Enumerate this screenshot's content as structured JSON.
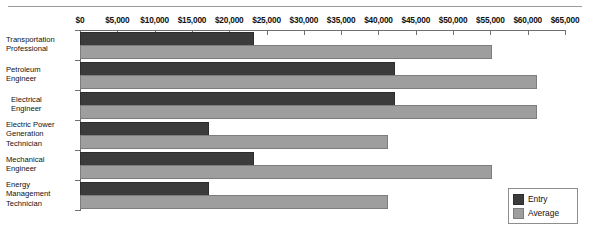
{
  "chart_data": {
    "type": "bar",
    "orientation": "horizontal",
    "title": "",
    "xlabel": "",
    "ylabel": "",
    "xlim": [
      0,
      65000
    ],
    "xtick_values": [
      0,
      5000,
      10000,
      15000,
      20000,
      25000,
      30000,
      35000,
      40000,
      45000,
      50000,
      55000,
      60000,
      65000
    ],
    "xtick_labels": [
      "$0",
      "$5,000",
      "$10,000",
      "$15,000",
      "$20,000",
      "$25,000",
      "$30,000",
      "$35,000",
      "$40,000",
      "$45,000",
      "$50,000",
      "$55,000",
      "$60,000",
      "$65,000"
    ],
    "grid": false,
    "legend_position": "bottom-right",
    "categories": [
      "Transportation Professional",
      "Petroleum Engineer",
      "Electrical Engineer",
      "Electric Power Generation Technician",
      "Mechanical Engineer",
      "Energy Management Technician"
    ],
    "category_lines": [
      [
        "Transportation",
        "Professional"
      ],
      [
        "Petroleum",
        "Engineer"
      ],
      [
        "Electrical",
        "Engineer"
      ],
      [
        "Electric Power",
        "Generation",
        "Technician"
      ],
      [
        "Mechanical",
        "Engineer"
      ],
      [
        "Energy",
        "Management",
        "Technician"
      ]
    ],
    "series": [
      {
        "name": "Entry",
        "color": "#3b3b3b",
        "values": [
          23000,
          42000,
          42000,
          17000,
          23000,
          17000
        ]
      },
      {
        "name": "Average",
        "color": "#9e9e9e",
        "values": [
          55000,
          61000,
          61000,
          41000,
          55000,
          41000
        ]
      }
    ]
  },
  "legend": {
    "items": [
      {
        "label": "Entry"
      },
      {
        "label": "Average"
      }
    ]
  },
  "colors": {
    "entry": "#3b3b3b",
    "average": "#9e9e9e",
    "axis": "#6f6f6f",
    "rule": "#9b9b9b"
  }
}
